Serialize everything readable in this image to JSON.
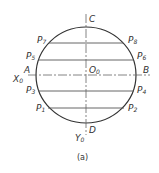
{
  "diagram": {
    "type": "circle-with-chords",
    "stroke_color": "#333333",
    "center_label": {
      "main": "O",
      "sub": "0"
    },
    "axis_labels": {
      "left": {
        "main": "A"
      },
      "right": {
        "main": "B"
      },
      "top": {
        "main": "C"
      },
      "bottom": {
        "main": "D"
      },
      "x_axis": {
        "main": "X",
        "sub": "0"
      },
      "y_axis": {
        "main": "Y",
        "sub": "0"
      }
    },
    "points": [
      {
        "main": "P",
        "sub": "7",
        "side": "left"
      },
      {
        "main": "P",
        "sub": "8",
        "side": "right"
      },
      {
        "main": "P",
        "sub": "5",
        "side": "left"
      },
      {
        "main": "P",
        "sub": "6",
        "side": "right"
      },
      {
        "main": "P",
        "sub": "3",
        "side": "left"
      },
      {
        "main": "P",
        "sub": "4",
        "side": "right"
      },
      {
        "main": "P",
        "sub": "1",
        "side": "left"
      },
      {
        "main": "P",
        "sub": "2",
        "side": "right"
      }
    ],
    "caption": "(a)"
  }
}
